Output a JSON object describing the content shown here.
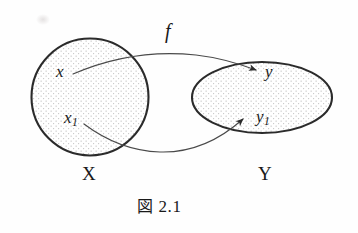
{
  "figure": {
    "caption_kanji": "図",
    "caption_number": "2.1",
    "caption_full": "図 2.1",
    "map_label": "f",
    "domain": {
      "name": "X",
      "shape": "circle",
      "center_x": 90,
      "center_y": 97,
      "radius": 59,
      "fill": "stippled",
      "elements": [
        {
          "label": "x",
          "sub": "",
          "x": 62,
          "y": 72
        },
        {
          "label": "x",
          "sub": "1",
          "x": 71,
          "y": 118
        }
      ]
    },
    "codomain": {
      "name": "Y",
      "shape": "ellipse",
      "center_x": 262,
      "center_y": 97,
      "radius_x": 70,
      "radius_y": 36,
      "fill": "stippled",
      "elements": [
        {
          "label": "y",
          "sub": "",
          "x": 270,
          "y": 72
        },
        {
          "label": "y",
          "sub": "1",
          "x": 262,
          "y": 117
        }
      ]
    },
    "arrows": [
      {
        "name": "arrow-x-to-y",
        "from": "x",
        "to": "y",
        "style": "curved",
        "direction": "left-to-right-over-top"
      },
      {
        "name": "arrow-x1-to-y1",
        "from": "x1",
        "to": "y1",
        "style": "curved",
        "direction": "left-to-right-under-bottom"
      }
    ]
  },
  "colors": {
    "ink": "#191919",
    "outline": "#2b2b2b",
    "arrow": "#4a4a4a",
    "stipple": "#b9b9b9",
    "page": "#fefefe"
  }
}
